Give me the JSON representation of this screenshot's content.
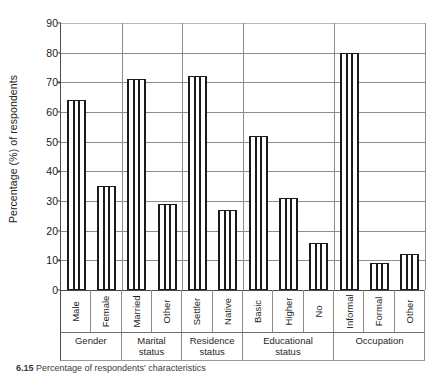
{
  "chart_data": {
    "type": "bar",
    "title": "",
    "xlabel": "",
    "ylabel": "Percentage (%) of respondents",
    "ylim": [
      0,
      90
    ],
    "ytick_step": 10,
    "yticks": [
      0,
      10,
      20,
      30,
      40,
      50,
      60,
      70,
      80,
      90
    ],
    "grid": true,
    "legend": "none",
    "orientation": "vertical",
    "bar_fill": "vertical-stripe-hatch",
    "categories": [
      "Male",
      "Female",
      "Married",
      "Other",
      "Settler",
      "Native",
      "Basic",
      "Higher",
      "No",
      "Informal",
      "Formal",
      "Other"
    ],
    "values": [
      64,
      35,
      71,
      29,
      72,
      27,
      52,
      31,
      16,
      80,
      9,
      12
    ],
    "groups": [
      {
        "label_line1": "Gender",
        "label_line2": "",
        "categories": [
          "Male",
          "Female"
        ],
        "values": [
          64,
          35
        ]
      },
      {
        "label_line1": "Marital",
        "label_line2": "status",
        "categories": [
          "Married",
          "Other"
        ],
        "values": [
          71,
          29
        ]
      },
      {
        "label_line1": "Residence",
        "label_line2": "status",
        "categories": [
          "Settler",
          "Native"
        ],
        "values": [
          72,
          27
        ]
      },
      {
        "label_line1": "Educational",
        "label_line2": "status",
        "categories": [
          "Basic",
          "Higher",
          "No"
        ],
        "values": [
          52,
          31,
          16
        ]
      },
      {
        "label_line1": "Occupation",
        "label_line2": "",
        "categories": [
          "Informal",
          "Formal",
          "Other"
        ],
        "values": [
          80,
          9,
          12
        ]
      }
    ]
  },
  "caption": {
    "number": "6.15",
    "text": "Percentage of respondents' characteristics"
  },
  "colors": {
    "bar_outline": "#1b1b1b",
    "bar_fill": "#ffffff",
    "grid": "#8d8d8d",
    "axis": "#4a4a4a",
    "text": "#1f1f1f"
  }
}
